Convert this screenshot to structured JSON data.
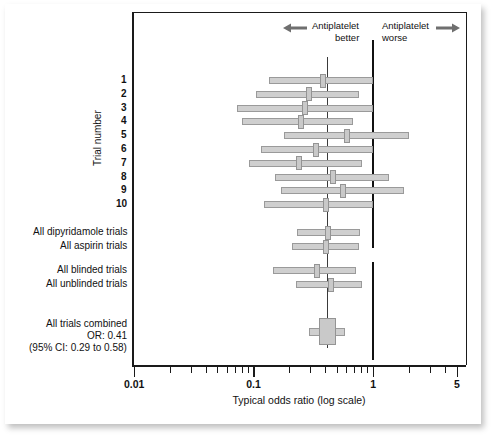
{
  "figure": {
    "domain": "chart",
    "background": "#ffffff"
  },
  "annotations": {
    "left_arrow_icon": "left-arrow-icon",
    "right_arrow_icon": "right-arrow-icon",
    "better_line1": "Antiplatelet",
    "better_line2": "better",
    "worse_line1": "Antiplatelet",
    "worse_line2": "worse"
  },
  "axes": {
    "y_axis_title": "Trial number",
    "x_axis_title": "Typical odds ratio (log scale)",
    "x_tick_labels": [
      "0.01",
      "0.1",
      "1",
      "5"
    ],
    "x_tick_values": [
      0.01,
      0.1,
      1,
      5
    ],
    "xlim": [
      0.01,
      5
    ],
    "scale": "log",
    "grid": false
  },
  "reference_lines": {
    "null_value": 1,
    "null_color": "#111111",
    "pooled_value": 0.41,
    "pooled_color": "#3a3a3a"
  },
  "chart_data": {
    "type": "forest",
    "title": "",
    "subtitle": "",
    "xlabel": "Typical odds ratio (log scale)",
    "ylabel": "Trial number",
    "xlim": [
      0.01,
      5
    ],
    "scale": "log",
    "grid": false,
    "legend": "none",
    "effect_measure": "Typical odds ratio",
    "rows": [
      {
        "label": "1",
        "group": "trial",
        "or": 0.38,
        "ci_low": 0.135,
        "ci_high": 1.0
      },
      {
        "label": "2",
        "group": "trial",
        "or": 0.29,
        "ci_low": 0.105,
        "ci_high": 0.76
      },
      {
        "label": "3",
        "group": "trial",
        "or": 0.27,
        "ci_low": 0.072,
        "ci_high": 1.0
      },
      {
        "label": "4",
        "group": "trial",
        "or": 0.25,
        "ci_low": 0.08,
        "ci_high": 0.67
      },
      {
        "label": "5",
        "group": "trial",
        "or": 0.6,
        "ci_low": 0.18,
        "ci_high": 2.0
      },
      {
        "label": "6",
        "group": "trial",
        "or": 0.33,
        "ci_low": 0.115,
        "ci_high": 1.0
      },
      {
        "label": "7",
        "group": "trial",
        "or": 0.24,
        "ci_low": 0.092,
        "ci_high": 0.8
      },
      {
        "label": "8",
        "group": "trial",
        "or": 0.46,
        "ci_low": 0.15,
        "ci_high": 1.35
      },
      {
        "label": "9",
        "group": "trial",
        "or": 0.56,
        "ci_low": 0.17,
        "ci_high": 1.8
      },
      {
        "label": "10",
        "group": "trial",
        "or": 0.4,
        "ci_low": 0.122,
        "ci_high": 1.0
      },
      {
        "label": "All dipyridamole trials",
        "group": "summary",
        "or": 0.42,
        "ci_low": 0.23,
        "ci_high": 0.78
      },
      {
        "label": "All aspirin trials",
        "group": "summary",
        "or": 0.4,
        "ci_low": 0.21,
        "ci_high": 0.76
      },
      {
        "label": "All blinded trials",
        "group": "summary",
        "or": 0.34,
        "ci_low": 0.145,
        "ci_high": 0.72
      },
      {
        "label": "All unblinded trials",
        "group": "summary",
        "or": 0.44,
        "ci_low": 0.225,
        "ci_high": 0.8
      },
      {
        "label": "All trials combined",
        "group": "overall",
        "or": 0.41,
        "ci_low": 0.29,
        "ci_high": 0.58
      }
    ],
    "overall": {
      "label_line1": "All trials combined",
      "label_line2": "OR: 0.41",
      "label_line3": "(95% CI: 0.29 to 0.58)",
      "or": 0.41,
      "ci_low": 0.29,
      "ci_high": 0.58
    }
  }
}
